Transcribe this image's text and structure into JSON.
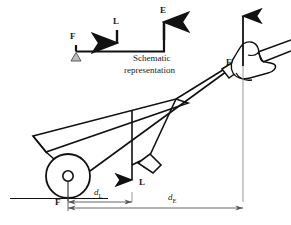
{
  "figure": {
    "schematic": {
      "caption_line1": "Schematic",
      "caption_line2": "representation",
      "fulcrum_label": "F",
      "load_label": "L",
      "effort_label": "E",
      "fulcrum_icon": "triangle-fulcrum-icon",
      "load_arrow_icon": "down-arrow-icon",
      "effort_arrow_icon": "up-arrow-icon"
    },
    "main": {
      "effort_label": "E",
      "load_label": "L",
      "fulcrum_label": "F",
      "distance_load_label": "d",
      "distance_load_sub": "L",
      "distance_effort_label": "d",
      "distance_effort_sub": "E",
      "effort_arrow_icon": "up-arrow-icon",
      "load_arrow_icon": "down-arrow-icon",
      "wheel_icon": "wheel-icon",
      "hand_icon": "hand-grip-icon",
      "body_icon": "wheelbarrow-tray-icon",
      "leg_icon": "support-leg-icon",
      "ground_icon": "ground-line-icon"
    },
    "colors": {
      "ink": "#111111",
      "grey_line": "#8d8d8d",
      "fulcrum_fill": "#b9b9b9",
      "background": "#ffffff"
    }
  }
}
